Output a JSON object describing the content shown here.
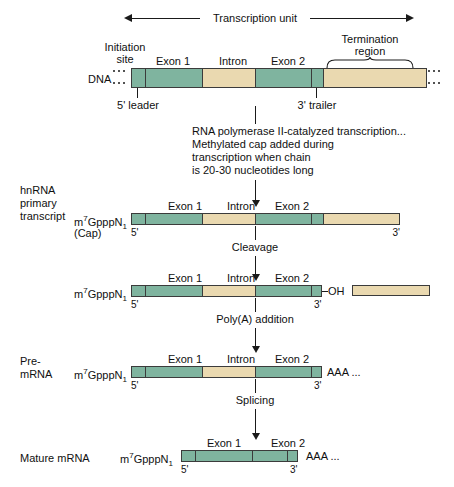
{
  "transcription_unit": {
    "label": "Transcription unit"
  },
  "dna_row": {
    "row_label": "DNA",
    "initiation_site_label_line1": "Initiation",
    "initiation_site_label_line2": "site",
    "termination_label_line1": "Termination",
    "termination_label_line2": "region",
    "leader_label": "5' leader",
    "trailer_label": "3' trailer",
    "segments": [
      {
        "name": "5-leader",
        "type": "utr",
        "label": ""
      },
      {
        "name": "exon-1",
        "type": "exon",
        "label": "Exon 1"
      },
      {
        "name": "intron",
        "type": "intron",
        "label": "Intron"
      },
      {
        "name": "exon-2",
        "type": "exon",
        "label": "Exon 2"
      },
      {
        "name": "3-trailer",
        "type": "utr",
        "label": ""
      },
      {
        "name": "termination-region",
        "type": "tail",
        "label": ""
      }
    ]
  },
  "step_transcription": {
    "line1": "RNA polymerase II-catalyzed transcription...",
    "line2": "Methylated cap added during",
    "line3": "transcription when chain",
    "line4": "is 20-30 nucleotides long"
  },
  "hnrna_row": {
    "row_label_line1": "hnRNA",
    "row_label_line2": "primary",
    "row_label_line3": "transcript",
    "cap_label": "m",
    "cap_sup": "7",
    "cap_mid": "GpppN",
    "cap_sub": "1",
    "cap_note": "(Cap)",
    "five_prime": "5'",
    "three_prime": "3'",
    "exon1_label": "Exon 1",
    "intron_label": "Intron",
    "exon2_label": "Exon 2"
  },
  "step_cleavage": {
    "label": "Cleavage"
  },
  "cleaved_row": {
    "cap_label": "m",
    "cap_sup": "7",
    "cap_mid": "GpppN",
    "cap_sub": "1",
    "oh_label": "OH",
    "five_prime": "5'",
    "three_prime": "3'",
    "exon1_label": "Exon 1",
    "intron_label": "Intron",
    "exon2_label": "Exon 2"
  },
  "step_polya": {
    "label": "Poly(A) addition"
  },
  "premrna_row": {
    "row_label_line1": "Pre-",
    "row_label_line2": "mRNA",
    "cap_label": "m",
    "cap_sup": "7",
    "cap_mid": "GpppN",
    "cap_sub": "1",
    "polya_label": "AAA ...",
    "five_prime": "5'",
    "three_prime": "3'",
    "exon1_label": "Exon 1",
    "intron_label": "Intron",
    "exon2_label": "Exon 2"
  },
  "step_splicing": {
    "label": "Splicing"
  },
  "mature_row": {
    "row_label": "Mature mRNA",
    "cap_label": "m",
    "cap_sup": "7",
    "cap_mid": "GpppN",
    "cap_sub": "1",
    "polya_label": "AAA ...",
    "five_prime": "5'",
    "three_prime": "3'",
    "exon1_label": "Exon 1",
    "exon2_label": "Exon 2"
  },
  "colors": {
    "exon_green": "#7fb49f",
    "intron_tan": "#ead9b0",
    "outline": "#3b3b3b",
    "text": "#101010",
    "background": "#ffffff"
  }
}
